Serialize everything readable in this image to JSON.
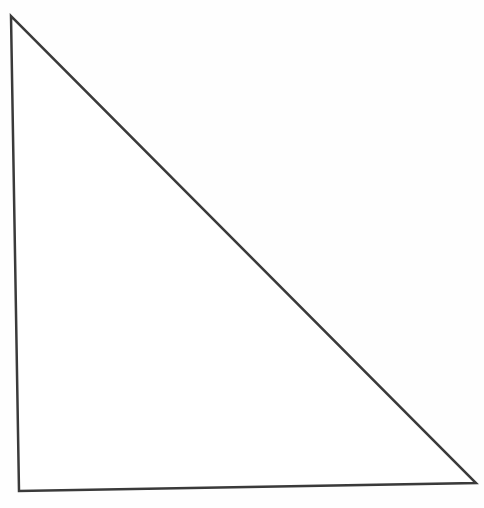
{
  "diagram": {
    "shape": "right-triangle",
    "vertices": [
      {
        "name": "top",
        "x": 11,
        "y": 16
      },
      {
        "name": "bottom-left",
        "x": 19,
        "y": 491
      },
      {
        "name": "bottom-right",
        "x": 476,
        "y": 483
      }
    ],
    "stroke_color": "#3a3a3a",
    "fill_color": "#ffffff",
    "stroke_width": 2.5,
    "labels": []
  }
}
